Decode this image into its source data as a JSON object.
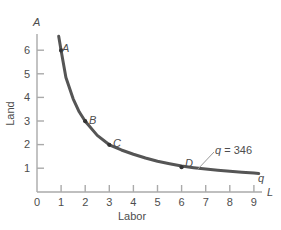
{
  "chart_data": {
    "type": "line",
    "title": "",
    "subtitle": "",
    "xlabel": "Labor",
    "ylabel": "Land",
    "x_axis_symbol": "L",
    "y_axis_symbol": "A",
    "xlim": [
      0,
      9.5
    ],
    "ylim": [
      0,
      6.8
    ],
    "xticks": [
      "0",
      "1",
      "2",
      "3",
      "4",
      "5",
      "6",
      "7",
      "8",
      "9"
    ],
    "yticks": [
      "1",
      "2",
      "3",
      "4",
      "5",
      "6"
    ],
    "grid": false,
    "legend_position": "none",
    "series": [
      {
        "name": "q = 346",
        "curve_label": "q",
        "annotation": "q = 346",
        "annotation_symbol": "q",
        "annotation_value": "= 346",
        "x": [
          0.9,
          1.0,
          1.2,
          1.5,
          1.75,
          2.0,
          2.5,
          3.0,
          3.5,
          4.0,
          4.5,
          5.0,
          5.5,
          6.0,
          6.5,
          7.0,
          7.5,
          8.0,
          8.5,
          9.0,
          9.2
        ],
        "y": [
          6.6,
          6.0,
          4.85,
          3.95,
          3.4,
          3.0,
          2.4,
          2.0,
          1.78,
          1.6,
          1.44,
          1.3,
          1.2,
          1.1,
          1.03,
          0.97,
          0.92,
          0.88,
          0.84,
          0.8,
          0.78
        ]
      }
    ],
    "points": [
      {
        "label": "A",
        "x": 1.0,
        "y": 6.0
      },
      {
        "label": "B",
        "x": 2.0,
        "y": 3.0
      },
      {
        "label": "C",
        "x": 3.0,
        "y": 2.0
      },
      {
        "label": "D",
        "x": 6.0,
        "y": 1.05
      }
    ],
    "colors": {
      "curve": "#555555",
      "axis": "#aaaaaa",
      "text": "#4d4d4d",
      "background": "#ffffff",
      "point": "#333333"
    }
  }
}
